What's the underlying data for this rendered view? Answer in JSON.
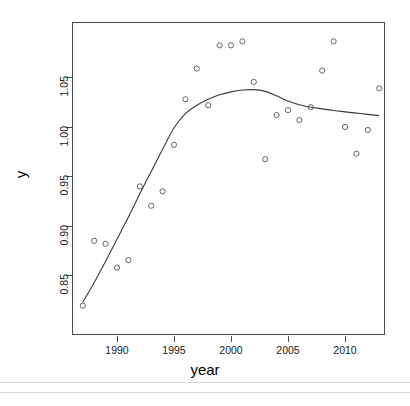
{
  "chart_data": {
    "type": "scatter",
    "title": "",
    "xlabel": "year",
    "ylabel": "y",
    "grid": false,
    "legend": null,
    "xlim": [
      1986.4,
      2013.9
    ],
    "ylim": [
      0.8145,
      1.0895
    ],
    "xticks": [
      1990,
      1995,
      2000,
      2005,
      2010
    ],
    "xtick_labels": [
      "1990",
      "1995",
      "2000",
      "2005",
      "2010"
    ],
    "yticks": [
      0.85,
      0.9,
      0.95,
      1.0,
      1.05
    ],
    "ytick_labels": [
      "0.85",
      "0.90",
      "0.95",
      "1.00",
      "1.05"
    ],
    "marker": "open-circle",
    "marker_color": "#555555",
    "line_color": "#3a3a3a",
    "points": [
      {
        "x": 1987,
        "y": 0.819
      },
      {
        "x": 1988,
        "y": 0.8845
      },
      {
        "x": 1989,
        "y": 0.8815
      },
      {
        "x": 1990,
        "y": 0.8575
      },
      {
        "x": 1991,
        "y": 0.865
      },
      {
        "x": 1992,
        "y": 0.9395
      },
      {
        "x": 1993,
        "y": 0.92
      },
      {
        "x": 1994,
        "y": 0.9345
      },
      {
        "x": 1995,
        "y": 0.9815
      },
      {
        "x": 1996,
        "y": 1.0275
      },
      {
        "x": 1997,
        "y": 1.0585
      },
      {
        "x": 1998,
        "y": 1.0215
      },
      {
        "x": 1999,
        "y": 1.082
      },
      {
        "x": 2000,
        "y": 1.082
      },
      {
        "x": 2001,
        "y": 1.086
      },
      {
        "x": 2002,
        "y": 1.045
      },
      {
        "x": 2003,
        "y": 0.967
      },
      {
        "x": 2004,
        "y": 1.0115
      },
      {
        "x": 2005,
        "y": 1.0165
      },
      {
        "x": 2006,
        "y": 1.0065
      },
      {
        "x": 2007,
        "y": 1.0195
      },
      {
        "x": 2008,
        "y": 1.0565
      },
      {
        "x": 2009,
        "y": 1.086
      },
      {
        "x": 2010,
        "y": 0.9995
      },
      {
        "x": 2011,
        "y": 0.9725
      },
      {
        "x": 2012,
        "y": 0.9965
      },
      {
        "x": 2013,
        "y": 1.0385
      }
    ],
    "smooth_curve": [
      {
        "x": 1987.0,
        "y": 0.8225
      },
      {
        "x": 1988.0,
        "y": 0.8425
      },
      {
        "x": 1989.0,
        "y": 0.864
      },
      {
        "x": 1990.0,
        "y": 0.886
      },
      {
        "x": 1991.0,
        "y": 0.9085
      },
      {
        "x": 1992.0,
        "y": 0.932
      },
      {
        "x": 1993.0,
        "y": 0.9545
      },
      {
        "x": 1994.0,
        "y": 0.977
      },
      {
        "x": 1995.0,
        "y": 0.9985
      },
      {
        "x": 1996.0,
        "y": 1.013
      },
      {
        "x": 1997.0,
        "y": 1.0215
      },
      {
        "x": 1998.0,
        "y": 1.0275
      },
      {
        "x": 1999.0,
        "y": 1.032
      },
      {
        "x": 2000.0,
        "y": 1.035
      },
      {
        "x": 2001.0,
        "y": 1.0368
      },
      {
        "x": 2002.0,
        "y": 1.0372
      },
      {
        "x": 2003.0,
        "y": 1.0355
      },
      {
        "x": 2004.0,
        "y": 1.031
      },
      {
        "x": 2005.0,
        "y": 1.0258
      },
      {
        "x": 2006.0,
        "y": 1.022
      },
      {
        "x": 2007.0,
        "y": 1.0195
      },
      {
        "x": 2008.0,
        "y": 1.0178
      },
      {
        "x": 2009.0,
        "y": 1.0162
      },
      {
        "x": 2010.0,
        "y": 1.0148
      },
      {
        "x": 2011.0,
        "y": 1.0135
      },
      {
        "x": 2012.0,
        "y": 1.0122
      },
      {
        "x": 2013.0,
        "y": 1.011
      }
    ]
  },
  "geometry": {
    "plot_left": 72,
    "plot_right": 385,
    "plot_top": 22,
    "plot_bottom": 335,
    "x_ref_year": 1990,
    "x_ref_px": 117,
    "x_px_per_year": 11.4,
    "y_ref_value": 1.05,
    "y_ref_px": 77,
    "y_px_per_unit": 990
  }
}
